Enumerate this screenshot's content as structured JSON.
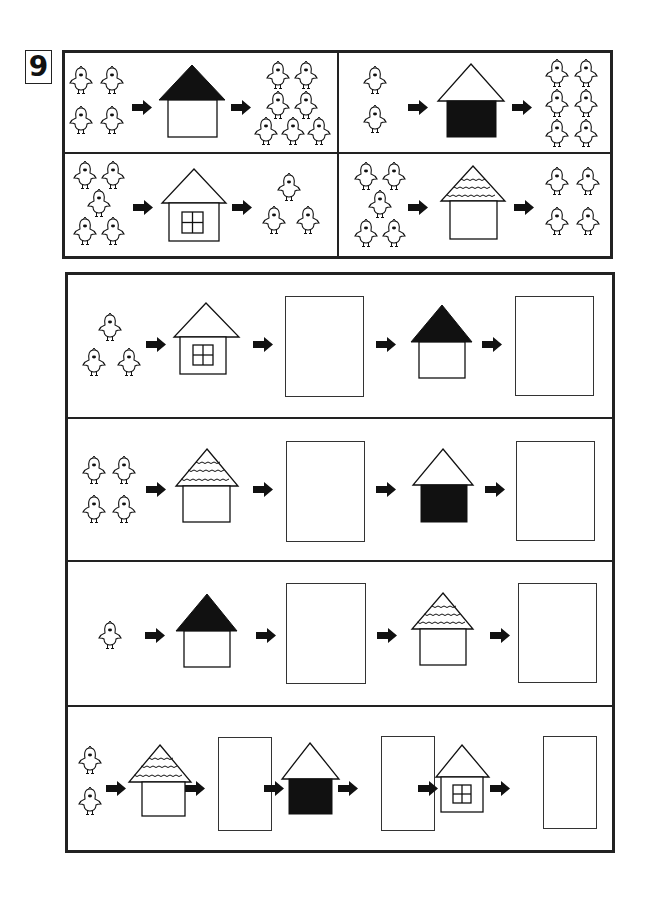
{
  "worksheet": {
    "problem_number": "9",
    "colors": {
      "ink": "#111111",
      "paper": "#ffffff"
    }
  },
  "legend": {
    "examples": [
      {
        "input_chicks": 4,
        "house": "black-roof-house",
        "output_chicks": 7,
        "rule": "+3"
      },
      {
        "input_chicks": 2,
        "house": "black-wall-house",
        "output_chicks": 6,
        "rule": "x3"
      },
      {
        "input_chicks": 5,
        "house": "window-house",
        "output_chicks": 3,
        "rule": "-2"
      },
      {
        "input_chicks": 5,
        "house": "scalloped-roof-house",
        "output_chicks": 4,
        "rule": "-1"
      }
    ]
  },
  "exercises": [
    {
      "start_chicks": 3,
      "steps": [
        "window-house",
        "black-roof-house"
      ],
      "answer_boxes": 2
    },
    {
      "start_chicks": 4,
      "steps": [
        "scalloped-roof-house",
        "black-wall-house"
      ],
      "answer_boxes": 2
    },
    {
      "start_chicks": 1,
      "steps": [
        "black-roof-house",
        "scalloped-roof-house"
      ],
      "answer_boxes": 2
    },
    {
      "start_chicks": 2,
      "steps": [
        "scalloped-roof-house",
        "black-wall-house",
        "window-house"
      ],
      "answer_boxes": 3
    }
  ]
}
